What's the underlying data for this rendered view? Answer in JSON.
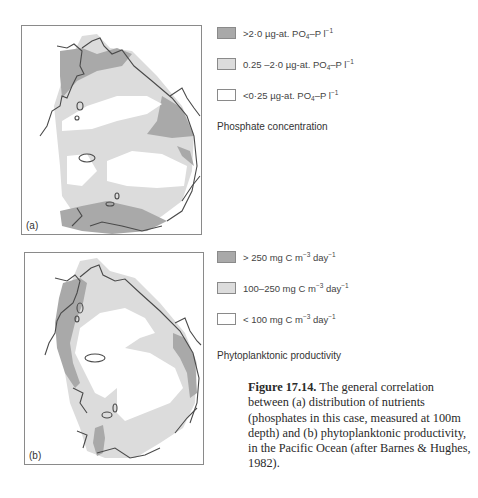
{
  "colors": {
    "high": "#a9a9a9",
    "medium": "#dcdcdc",
    "low": "#ffffff",
    "coast": "#4a4a4a",
    "frame": "#8a8a8a"
  },
  "panel_a": {
    "label": "(a)",
    "legend": [
      {
        "level": "high",
        "prefix": ">2·0 µg-at. PO",
        "sub": "4",
        "mid": "–P l",
        "sup": "−1"
      },
      {
        "level": "medium",
        "prefix": "0.25 –2·0 µg-at. PO",
        "sub": "4",
        "mid": "–P l",
        "sup": "−1"
      },
      {
        "level": "low",
        "prefix": "<0·25 µg-at. PO",
        "sub": "4",
        "mid": "–P l",
        "sup": "−1"
      }
    ],
    "legend_title": "Phosphate concentration"
  },
  "panel_b": {
    "label": "(b)",
    "legend": [
      {
        "level": "high",
        "prefix": "> 250 mg C m",
        "sup1": "−3",
        "mid": " day",
        "sup2": "−1"
      },
      {
        "level": "medium",
        "prefix": "100–250 mg C m",
        "sup1": "−3",
        "mid": " day",
        "sup2": "−1"
      },
      {
        "level": "low",
        "prefix": "< 100 mg C m",
        "sup1": "−3",
        "mid": " day",
        "sup2": "−1"
      }
    ],
    "legend_title": "Phytoplanktonic productivity"
  },
  "caption": {
    "figure_label": "Figure 17.14.",
    "text": " The general correlation between (a) distribution of nutrients (phosphates in this case, measured at 100m depth) and (b) phytoplanktonic productivity, in the Pacific Ocean (after Barnes & Hughes, 1982)."
  }
}
